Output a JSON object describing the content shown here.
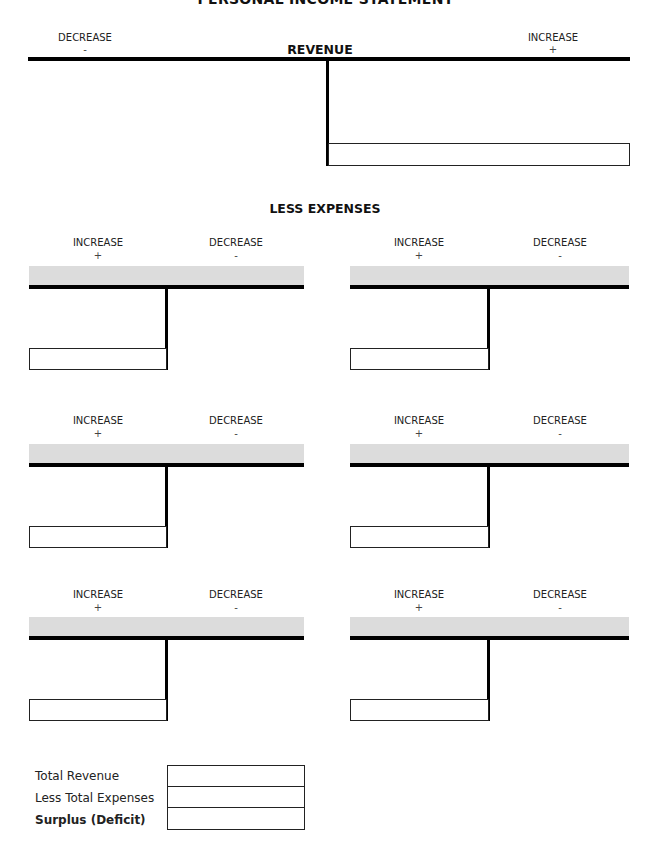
{
  "document": {
    "title": "PERSONAL INCOME STATEMENT"
  },
  "revenue": {
    "heading": "REVENUE",
    "left_label": "DECREASE",
    "left_sign": "-",
    "right_label": "INCREASE",
    "right_sign": "+"
  },
  "expenses": {
    "heading": "LESS EXPENSES",
    "accounts": [
      {
        "left_label": "INCREASE",
        "left_sign": "+",
        "right_label": "DECREASE",
        "right_sign": "-"
      },
      {
        "left_label": "INCREASE",
        "left_sign": "+",
        "right_label": "DECREASE",
        "right_sign": "-"
      },
      {
        "left_label": "INCREASE",
        "left_sign": "+",
        "right_label": "DECREASE",
        "right_sign": "-"
      },
      {
        "left_label": "INCREASE",
        "left_sign": "+",
        "right_label": "DECREASE",
        "right_sign": "-"
      },
      {
        "left_label": "INCREASE",
        "left_sign": "+",
        "right_label": "DECREASE",
        "right_sign": "-"
      },
      {
        "left_label": "INCREASE",
        "left_sign": "+",
        "right_label": "DECREASE",
        "right_sign": "-"
      }
    ]
  },
  "totals": {
    "rows": [
      {
        "label": "Total Revenue",
        "value": ""
      },
      {
        "label": "Less Total Expenses",
        "value": ""
      },
      {
        "label": "Surplus (Deficit)",
        "value": ""
      }
    ]
  },
  "colors": {
    "line": "#000000",
    "band": "#dcdcdc",
    "background": "#ffffff"
  }
}
